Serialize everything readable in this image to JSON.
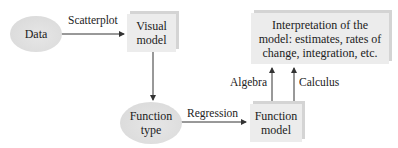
{
  "nodes": {
    "data": "Data",
    "visual_model_l1": "Visual",
    "visual_model_l2": "model",
    "function_type_l1": "Function",
    "function_type_l2": "type",
    "function_model_l1": "Function",
    "function_model_l2": "model",
    "interpretation_l1": "Interpretation of the",
    "interpretation_l2": "model: estimates, rates of",
    "interpretation_l3": "change, integration, etc."
  },
  "edges": {
    "scatterplot": "Scatterplot",
    "regression": "Regression",
    "algebra": "Algebra",
    "calculus": "Calculus"
  }
}
